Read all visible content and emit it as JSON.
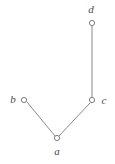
{
  "figure": {
    "kind": "graph-diagram",
    "width": 115,
    "height": 164,
    "background_color": "#ffffff",
    "edge_color": "#8a8a8a",
    "node_stroke_color": "#7d7d7d",
    "node_fill_color": "#ffffff",
    "label_color": "#4a4a4a",
    "node_radius": 2.6
  },
  "nodes": [
    {
      "id": "d",
      "label": "d",
      "cx": 92,
      "cy": 23,
      "label_x": 91,
      "label_y": 9,
      "label_position": "above"
    },
    {
      "id": "c",
      "label": "c",
      "cx": 92,
      "cy": 100,
      "label_x": 104,
      "label_y": 100,
      "label_position": "right"
    },
    {
      "id": "b",
      "label": "b",
      "cx": 24,
      "cy": 100,
      "label_x": 13,
      "label_y": 99,
      "label_position": "left"
    },
    {
      "id": "a",
      "label": "a",
      "cx": 57,
      "cy": 138,
      "label_x": 57,
      "label_y": 151,
      "label_position": "below"
    }
  ],
  "edges": [
    {
      "id": "d-c",
      "from": "d",
      "to": "c",
      "x1": 92,
      "y1": 26,
      "x2": 92,
      "y2": 97
    },
    {
      "id": "b-a",
      "from": "b",
      "to": "a",
      "x1": 27,
      "y1": 102,
      "x2": 55,
      "y2": 136
    },
    {
      "id": "a-c",
      "from": "a",
      "to": "c",
      "x1": 59,
      "y1": 136,
      "x2": 90,
      "y2": 103
    }
  ]
}
